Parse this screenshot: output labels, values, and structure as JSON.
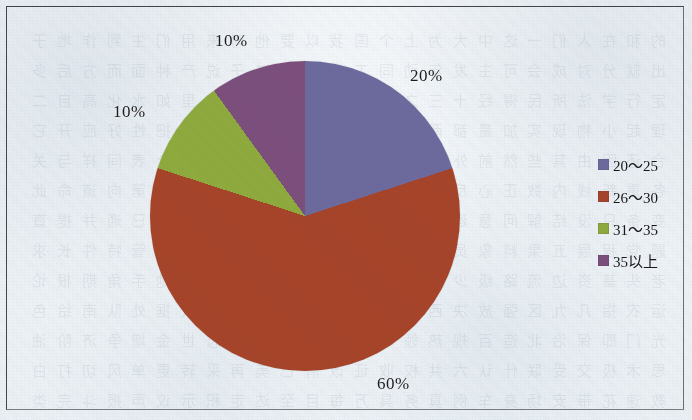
{
  "chart_data": {
    "type": "pie",
    "title": "",
    "categories": [
      "20～25",
      "26～30",
      "31～35",
      "35以上"
    ],
    "values": [
      20,
      60,
      10,
      10
    ],
    "labels": [
      "20%",
      "60%",
      "10%",
      "10%"
    ],
    "colors": [
      "#6d6b9e",
      "#a6452a",
      "#8fab3e",
      "#7c4f7c"
    ],
    "legend_position": "right",
    "grid": false,
    "start_angle_deg": 0,
    "direction": "clockwise",
    "unit": "%"
  },
  "labels": {
    "slice_20": "20%",
    "slice_60": "60%",
    "slice_10_green": "10%",
    "slice_10_purple": "10%"
  },
  "legend": {
    "items": [
      {
        "label": "20～25",
        "color": "#6d6b9e"
      },
      {
        "label": "26～30",
        "color": "#a6452a"
      },
      {
        "label": "31～35",
        "color": "#8fab3e"
      },
      {
        "label": "35以上",
        "color": "#7c4f7c"
      }
    ]
  },
  "page": {
    "background_color": "#f3f6f9",
    "border_color": "#2b2f35",
    "showthrough_text": "的 和 在 人 们 一 这 中 大 为 上 个 国 我 以 要 他 时 来 用 们 生 到 作 地 于 出 就 分 对 成 会 可 主 发 年 动 同 工 也 能 下 过 子 说 产 种 面 而 方 后 多 定 行 学 法 所 民 得 经 十 三 之 进 着 等 部 度 家 电 力 里 如 水 化 高 自 二 理 起 小 物 现 实 加 量 都 两 体 制 机 当 使 点 从 业 本 去 把 性 好 应 开 它 合 还 因 由 其 些 然 前 外 天 政 四 日 那 社 义 事 平 形 相 全 表 间 样 与 关 各 重 新 线 内 数 正 心 反 你 明 看 原 又 么 利 比 或 但 质 气 第 向 道 命 此 变 条 只 没 结 解 问 意 建 月 公 无 系 军 很 情 者 最 立 代 想 已 通 并 提 直 题 党 程 展 五 果 料 象 员 革 位 入 常 文 总 次 品 式 活 设 及 管 特 件 长 求 老 头 基 资 边 流 路 级 少 图 山 统 接 知 较 将 组 见 计 别 她 手 角 期 根 论 运 农 指 几 九 区 强 放 决 西 被 干 做 必 战 先 回 则 任 取 据 处 队 南 给 色 光 门 即 保 治 北 造 百 规 热 领 七 海 口 东 导 器 压 志 世 金 增 争 济 阶 油 思 术 极 交 受 联 什 认 六 共 权 收 证 改 清 己 美 再 采 转 更 单 风 切 打 白 教 速 花 带 安 场 身 车 例 真 务 具 万 每 目 至 达 走 积 示 议 声 报 斗 完 类 八 离 华 名 确 才 科 张 信 马 节 话 米 整 空 元 况 今 集 温 传 土 许 步 群 广 石 记 需 段 研 界 拉 林 律 叫 且 究 观 越 织 装 影 算 低 持 音 众 书 布 复 容 儿 须 际 商 非 验 连 断 深 难 近 矿 千 周 委 素 技 备 半 办 青 省 列 习 响 约 支 般 史 感 劳 便 团 往 酸 历 市 克 何 除 消 构 府 称 太 准 精 值 号 率 族 维 划 选 标 写 存 候 毛 亲 快 效 斯 院 查 江 型 眼 王 按 格 养 易 置 派 层 片 始 却 专 状 育 厂 京 识 适 属 圆 包 火 住 调 满 县 局 照 参 红 细 引 听 该 铁 价 严"
  }
}
